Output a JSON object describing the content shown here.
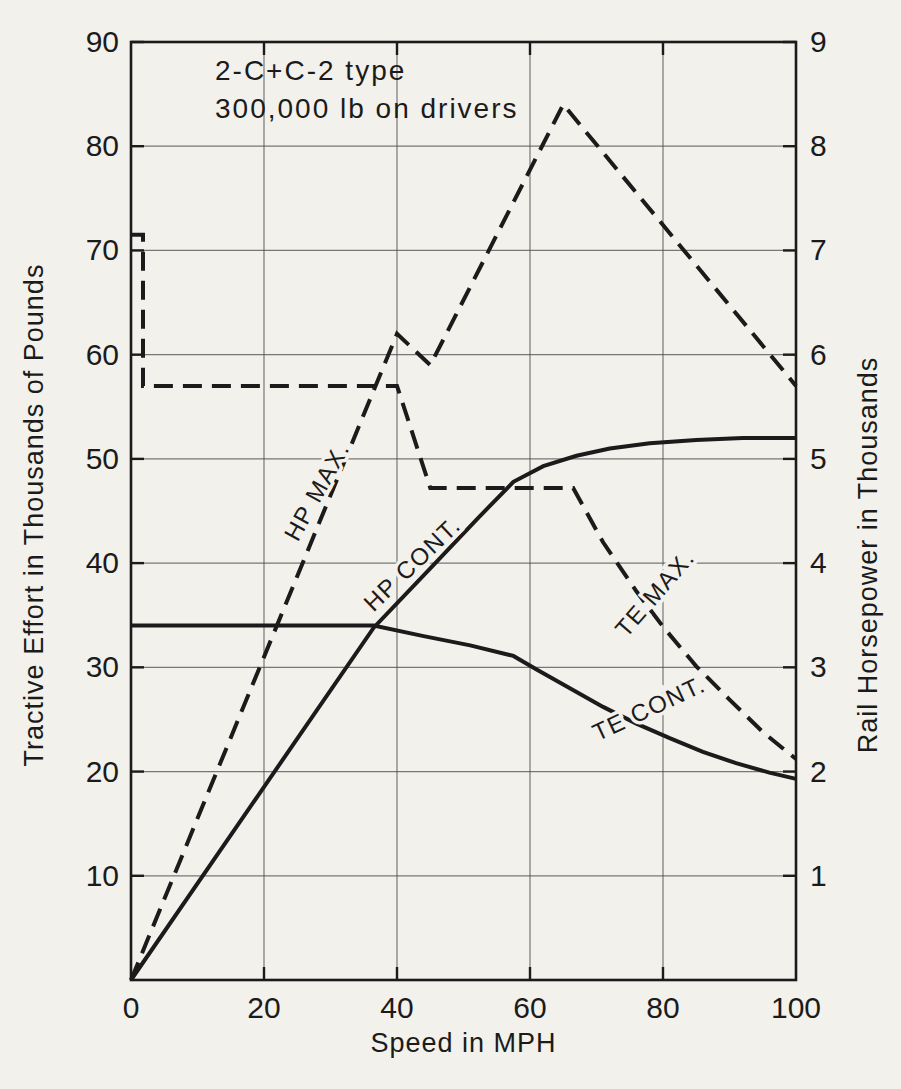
{
  "annotation": {
    "line1": "2-C+C-2  type",
    "line2": "300,000 lb   on drivers"
  },
  "chart_data": {
    "type": "line",
    "x_label": "Speed in MPH",
    "y_left_label": "Tractive Effort in Thousands of Pounds",
    "y_right_label": "Rail Horsepower in Thousands",
    "x_range": [
      0,
      100
    ],
    "y_left_range": [
      0,
      90
    ],
    "y_right_range": [
      0,
      9
    ],
    "x_ticks": [
      0,
      20,
      40,
      60,
      80,
      100
    ],
    "y_left_ticks": [
      10,
      20,
      30,
      40,
      50,
      60,
      70,
      80,
      90
    ],
    "y_right_ticks": [
      1,
      2,
      3,
      4,
      5,
      6,
      7,
      8,
      9
    ],
    "grid": true,
    "series": [
      {
        "name": "te-max",
        "label": "TE MAX.",
        "axis": "left",
        "style": "dashed",
        "points": [
          [
            0,
            71.5
          ],
          [
            1.8,
            71.5
          ],
          [
            1.8,
            57
          ],
          [
            40,
            57
          ],
          [
            45,
            47.2
          ],
          [
            66.5,
            47.2
          ],
          [
            71,
            42
          ],
          [
            76,
            37.3
          ],
          [
            80,
            33.9
          ],
          [
            85,
            30.1
          ],
          [
            90,
            26.9
          ],
          [
            95,
            23.8
          ],
          [
            100,
            21.2
          ]
        ],
        "label_anchor": {
          "x": 79,
          "y": 37,
          "angle": -49
        }
      },
      {
        "name": "te-cont",
        "label": "TE CONT.",
        "axis": "left",
        "style": "solid",
        "points": [
          [
            0,
            34
          ],
          [
            36.5,
            34
          ],
          [
            44,
            33
          ],
          [
            51,
            32.1
          ],
          [
            57.5,
            31.1
          ],
          [
            61,
            29.8
          ],
          [
            66,
            28.0
          ],
          [
            71,
            26.2
          ],
          [
            76,
            24.6
          ],
          [
            81,
            23.2
          ],
          [
            86,
            21.9
          ],
          [
            91,
            20.8
          ],
          [
            96,
            19.9
          ],
          [
            100,
            19.3
          ]
        ],
        "label_anchor": {
          "x": 78,
          "y": 25.9,
          "angle": -25
        }
      },
      {
        "name": "hp-max",
        "label": "HP MAX.",
        "axis": "right",
        "style": "dashed",
        "points": [
          [
            0,
            0
          ],
          [
            40,
            6.2
          ],
          [
            45,
            5.9
          ],
          [
            65,
            8.4
          ],
          [
            100,
            5.7
          ]
        ],
        "label_anchor": {
          "x": 28.2,
          "y": 4.68,
          "angle": -61
        }
      },
      {
        "name": "hp-cont",
        "label": "HP CONT.",
        "axis": "right",
        "style": "solid",
        "points": [
          [
            0,
            0
          ],
          [
            36.5,
            3.38
          ],
          [
            45,
            3.95
          ],
          [
            52,
            4.42
          ],
          [
            57.5,
            4.78
          ],
          [
            62,
            4.93
          ],
          [
            67,
            5.03
          ],
          [
            72,
            5.1
          ],
          [
            78,
            5.15
          ],
          [
            85,
            5.18
          ],
          [
            92,
            5.2
          ],
          [
            100,
            5.2
          ]
        ],
        "label_anchor": {
          "x": 42.5,
          "y": 3.98,
          "angle": -44
        }
      }
    ]
  },
  "colors": {
    "ink": "#1b1b1b",
    "grid": "#4f4f4f",
    "paper": "#f2f1ec"
  }
}
